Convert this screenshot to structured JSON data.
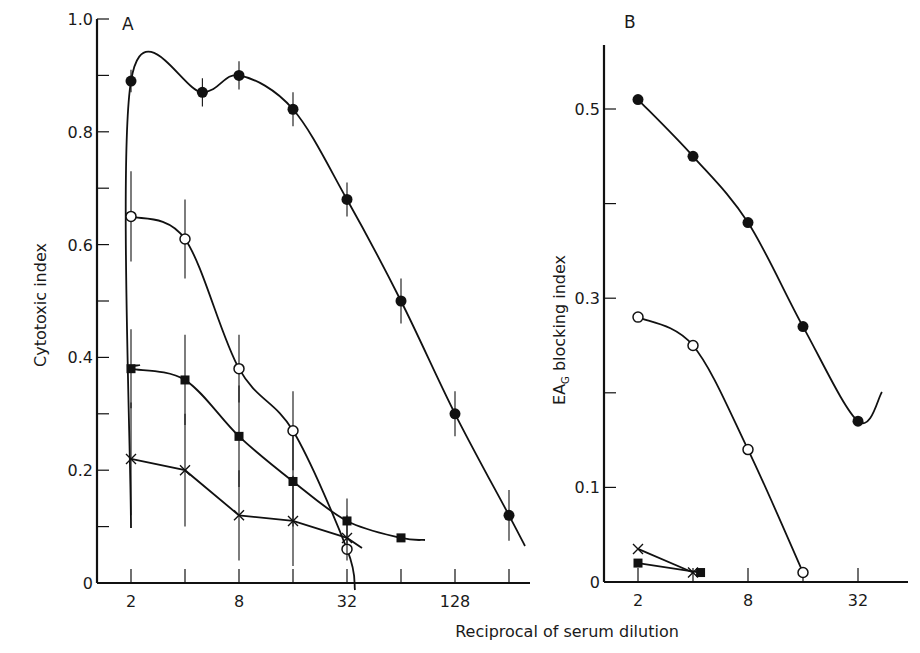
{
  "figure": {
    "xlabel": "Reciprocal of serum dilution"
  },
  "chart_data": [
    {
      "panel": "A",
      "type": "line",
      "title": "A",
      "xlabel": "Reciprocal of serum dilution",
      "ylabel": "Cytotoxic index",
      "xscale": "log2",
      "x_ticks": [
        2,
        4,
        8,
        16,
        32,
        64,
        128,
        256
      ],
      "x_tick_labels": [
        "2",
        "",
        "8",
        "",
        "32",
        "",
        "128",
        ""
      ],
      "y_ticks": [
        0,
        0.1,
        0.2,
        0.3,
        0.4,
        0.5,
        0.6,
        0.7,
        0.8,
        0.9,
        1.0
      ],
      "y_tick_labels": [
        "0",
        "",
        "0.2",
        "",
        "0.4",
        "",
        "0.6",
        "",
        "0.8",
        "",
        "1.0"
      ],
      "ylim": [
        0,
        1.0
      ],
      "grid": false,
      "series": [
        {
          "name": "filled-circle",
          "marker": "filled-circle",
          "x": [
            2,
            5,
            8,
            16,
            32,
            64,
            128,
            256
          ],
          "y": [
            0.89,
            0.87,
            0.9,
            0.84,
            0.68,
            0.5,
            0.3,
            0.12
          ],
          "err": [
            0.02,
            0.025,
            0.025,
            0.03,
            0.03,
            0.04,
            0.04,
            0.045
          ]
        },
        {
          "name": "open-circle",
          "marker": "open-circle",
          "x": [
            2,
            4,
            8,
            16,
            32
          ],
          "y": [
            0.65,
            0.61,
            0.38,
            0.27,
            0.06
          ],
          "err": [
            0.08,
            0.07,
            0.06,
            0.07,
            0.0
          ]
        },
        {
          "name": "filled-square",
          "marker": "filled-square",
          "x": [
            2,
            4,
            8,
            16,
            32,
            64
          ],
          "y": [
            0.38,
            0.36,
            0.26,
            0.18,
            0.11,
            0.08
          ],
          "err": [
            0.07,
            0.08,
            0.09,
            0.08,
            0.04,
            0.0
          ]
        },
        {
          "name": "cross",
          "marker": "cross",
          "x": [
            2,
            4,
            8,
            16,
            32
          ],
          "y": [
            0.22,
            0.2,
            0.12,
            0.11,
            0.08
          ],
          "err": [
            0.1,
            0.1,
            0.08,
            0.08,
            0.04
          ]
        }
      ]
    },
    {
      "panel": "B",
      "type": "line",
      "title": "B",
      "xlabel": "Reciprocal of serum dilution",
      "ylabel": "EA_G blocking index",
      "xscale": "log2",
      "x_ticks": [
        2,
        4,
        8,
        16,
        32
      ],
      "x_tick_labels": [
        "2",
        "",
        "8",
        "",
        "32"
      ],
      "y_ticks": [
        0,
        0.1,
        0.2,
        0.3,
        0.4,
        0.5
      ],
      "y_tick_labels": [
        "0",
        "0.1",
        "",
        "0.3",
        "",
        "0.5"
      ],
      "ylim": [
        0,
        0.57
      ],
      "grid": false,
      "series": [
        {
          "name": "filled-circle",
          "marker": "filled-circle",
          "x": [
            2,
            4,
            8,
            16,
            32
          ],
          "y": [
            0.51,
            0.45,
            0.38,
            0.27,
            0.17
          ]
        },
        {
          "name": "open-circle",
          "marker": "open-circle",
          "x": [
            2,
            4,
            8,
            16
          ],
          "y": [
            0.28,
            0.25,
            0.14,
            0.01
          ]
        },
        {
          "name": "filled-square",
          "marker": "filled-square",
          "x": [
            2,
            4.4
          ],
          "y": [
            0.02,
            0.01
          ]
        },
        {
          "name": "cross",
          "marker": "cross",
          "x": [
            2,
            4
          ],
          "y": [
            0.035,
            0.01
          ]
        }
      ]
    }
  ]
}
